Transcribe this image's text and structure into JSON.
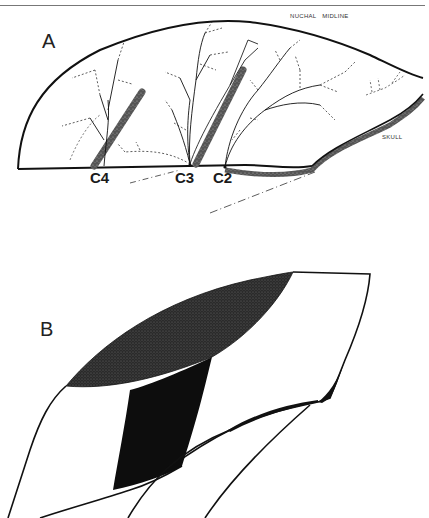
{
  "figure": {
    "top_caption_fragment": "",
    "panel_a": {
      "label": "A",
      "annotations": {
        "nuchal_midline": "NUCHAL   MIDLINE",
        "skull": "SKULL"
      },
      "vertebra_labels": [
        "C4",
        "C3",
        "C2"
      ]
    },
    "panel_b": {
      "label": "B"
    },
    "colors": {
      "ink": "#111111",
      "stipple": "#3a3a3a",
      "solid_fill": "#0d0d0d",
      "rule": "#777777",
      "background": "#ffffff"
    }
  }
}
